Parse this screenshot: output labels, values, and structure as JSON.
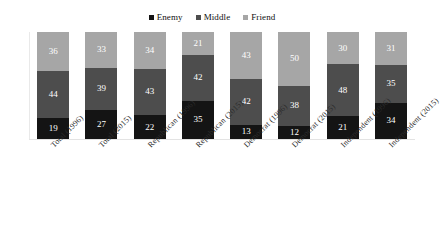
{
  "chart_data": {
    "type": "bar",
    "stacked": true,
    "orientation": "vertical",
    "title": "",
    "subtitle": "",
    "xlabel": "",
    "ylabel": "",
    "ylim": [
      0,
      100
    ],
    "grid": false,
    "legend_position": "top-center",
    "categories": [
      "Total (1996)",
      "Total (2015)",
      "Republican (1996)",
      "Republican (2015)",
      "Democrat (1996)",
      "Democrat (2015)",
      "Independent (1996)",
      "Independent (2015)"
    ],
    "series": [
      {
        "name": "Enemy",
        "color": "#141414",
        "values": [
          19,
          27,
          22,
          35,
          13,
          12,
          21,
          34
        ]
      },
      {
        "name": "Middle",
        "color": "#4d4d4d",
        "values": [
          44,
          39,
          43,
          42,
          42,
          38,
          48,
          35
        ]
      },
      {
        "name": "Friend",
        "color": "#a6a6a6",
        "values": [
          36,
          33,
          34,
          21,
          43,
          50,
          30,
          31
        ]
      }
    ],
    "stack_order_bottom_to_top": [
      "Enemy",
      "Middle",
      "Friend"
    ],
    "data_labels": true
  },
  "legend": {
    "items": [
      {
        "label": "Enemy",
        "color": "#141414"
      },
      {
        "label": "Middle",
        "color": "#4d4d4d"
      },
      {
        "label": "Friend",
        "color": "#a6a6a6"
      }
    ]
  }
}
